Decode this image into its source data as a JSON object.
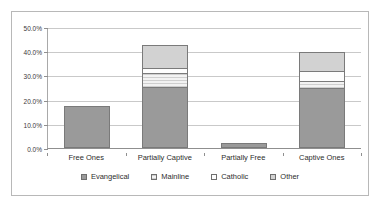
{
  "chart_data": {
    "type": "bar",
    "stacked": true,
    "title": "",
    "xlabel": "",
    "ylabel": "",
    "categories": [
      "Free Ones",
      "Partially Captive",
      "Partially Free",
      "Captive Ones"
    ],
    "series": [
      {
        "name": "Evangelical",
        "values": [
          17.2,
          25.2,
          2.2,
          25.0
        ],
        "color": "#9a9a9a",
        "swatch": "solid-gray"
      },
      {
        "name": "Mainline",
        "values": [
          0.0,
          5.8,
          0.0,
          2.8
        ],
        "color": "#e8e8e8",
        "swatch": "hatched-light"
      },
      {
        "name": "Catholic",
        "values": [
          0.0,
          2.0,
          0.0,
          4.0
        ],
        "color": "#fdfdfd",
        "swatch": "white"
      },
      {
        "name": "Other",
        "values": [
          0.0,
          9.5,
          0.0,
          7.7
        ],
        "color": "#d2d2d2",
        "swatch": "light-gray"
      }
    ],
    "ylim": [
      0,
      50
    ],
    "ytick_values": [
      0,
      10,
      20,
      30,
      40,
      50
    ],
    "ytick_labels": [
      "0.0%",
      "10.0%",
      "20.0%",
      "30.0%",
      "40.0%",
      "50.0%"
    ],
    "grid": true,
    "legend_position": "bottom",
    "totals": [
      17.2,
      42.5,
      2.2,
      39.5
    ]
  }
}
